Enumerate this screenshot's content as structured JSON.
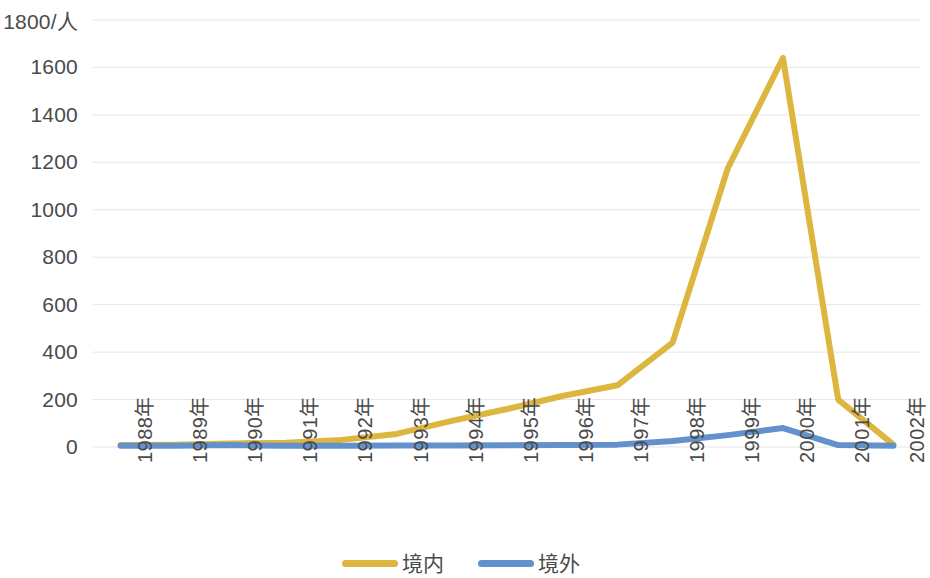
{
  "chart_data": {
    "type": "line",
    "title": "",
    "subtitle": "",
    "xlabel": "",
    "ylabel": "1800/人",
    "unit_label": "1800/人",
    "grid": true,
    "grid_axis": "y",
    "legend_position": "bottom",
    "ylim": [
      0,
      1800
    ],
    "ytick_step": 200,
    "ytick_labels": [
      "1800/人",
      "1600",
      "1400",
      "1200",
      "1000",
      "800",
      "600",
      "400",
      "200",
      "0"
    ],
    "yticks": [
      1800,
      1600,
      1400,
      1200,
      1000,
      800,
      600,
      400,
      200,
      0
    ],
    "categories": [
      "1988年",
      "1989年",
      "1990年",
      "1991年",
      "1992年",
      "1993年",
      "1994年",
      "1995年",
      "1996年",
      "1997年",
      "1998年",
      "1999年",
      "2000年",
      "2001年",
      "2002年"
    ],
    "series": [
      {
        "name": "境内",
        "color": "#DDB63F",
        "values": [
          8,
          10,
          15,
          18,
          30,
          55,
          110,
          160,
          215,
          260,
          440,
          1175,
          1640,
          200,
          10
        ]
      },
      {
        "name": "境外",
        "color": "#6291CB",
        "values": [
          5,
          5,
          8,
          5,
          5,
          6,
          6,
          7,
          8,
          10,
          25,
          50,
          80,
          8,
          5
        ]
      }
    ]
  },
  "legend": {
    "items": [
      {
        "label": "境内",
        "color": "#DDB63F"
      },
      {
        "label": "境外",
        "color": "#6291CB"
      }
    ]
  },
  "colors": {
    "series_domestic": "#DDB63F",
    "series_overseas": "#6291CB",
    "gridline": "#E6E6E6",
    "text": "#4a4a4a",
    "background": "#FFFFFF"
  }
}
